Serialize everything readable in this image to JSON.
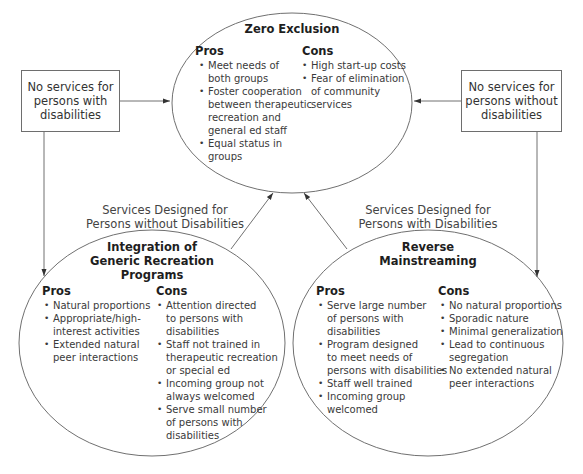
{
  "diagram": {
    "center_node": {
      "title": "Zero Exclusion",
      "pros_heading": "Pros",
      "cons_heading": "Cons",
      "pros": [
        "Meet needs of",
        "both groups",
        "Foster cooperation",
        "between therapeutic",
        "recreation and",
        "general ed staff",
        "Equal status in",
        "groups"
      ],
      "pros_items": [
        [
          "Meet needs of",
          "both groups"
        ],
        [
          "Foster cooperation",
          "between therapeutic",
          "recreation and",
          "general ed staff"
        ],
        [
          "Equal status in",
          "groups"
        ]
      ],
      "cons_items": [
        [
          "High start-up costs"
        ],
        [
          "Fear of elimination",
          "of community",
          "services"
        ]
      ]
    },
    "left_box": {
      "lines": [
        "No services for",
        "persons with",
        "disabilities"
      ]
    },
    "right_box": {
      "lines": [
        "No services for",
        "persons without",
        "disabilities"
      ]
    },
    "left_label": {
      "lines": [
        "Services Designed for",
        "Persons without Disabilities"
      ]
    },
    "right_label": {
      "lines": [
        "Services Designed for",
        "Persons with Disabilities"
      ]
    },
    "left_node": {
      "title_lines": [
        "Integration of",
        "Generic Recreation",
        "Programs"
      ],
      "pros_heading": "Pros",
      "cons_heading": "Cons",
      "pros_items": [
        [
          "Natural proportions"
        ],
        [
          "Appropriate/high-",
          "interest activities"
        ],
        [
          "Extended natural",
          "peer interactions"
        ]
      ],
      "cons_items": [
        [
          "Attention directed",
          "to persons with",
          "disabilities"
        ],
        [
          "Staff not trained in",
          "therapeutic recreation",
          "or special ed"
        ],
        [
          "Incoming group not",
          "always welcomed"
        ],
        [
          "Serve small number",
          "of persons with",
          "disabilities"
        ]
      ]
    },
    "right_node": {
      "title_lines": [
        "Reverse",
        "Mainstreaming"
      ],
      "pros_heading": "Pros",
      "cons_heading": "Cons",
      "pros_items": [
        [
          "Serve large number",
          "of persons with",
          "disabilities"
        ],
        [
          "Program designed",
          "to meet needs of",
          "persons with disabilities"
        ],
        [
          "Staff well trained"
        ],
        [
          "Incoming group",
          "welcomed"
        ]
      ],
      "cons_items": [
        [
          "No natural proportions"
        ],
        [
          "Sporadic nature"
        ],
        [
          "Minimal generalization"
        ],
        [
          "Lead to continuous",
          "segregation"
        ],
        [
          "No extended natural",
          "peer interactions"
        ]
      ]
    },
    "colors": {
      "line": "#6e6e6e",
      "text": "#333333",
      "heading": "#1e1e1e"
    }
  }
}
